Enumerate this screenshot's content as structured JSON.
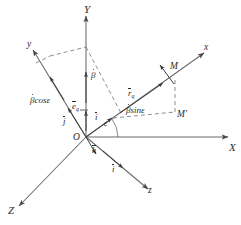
{
  "figure": {
    "background_color": "#ffffff",
    "line_color": "#555555",
    "text_color": "#2b2b2b",
    "width": 241,
    "height": 225
  },
  "axes": {
    "fixed_frame": [
      {
        "name": "axis-X",
        "label": "X",
        "direction": "right"
      },
      {
        "name": "axis-Y",
        "label": "Y",
        "direction": "up"
      },
      {
        "name": "axis-Z",
        "label": "Z",
        "direction": "lower-left"
      }
    ],
    "moving_frame": [
      {
        "name": "axis-x",
        "label": "x",
        "direction": "upper-right"
      },
      {
        "name": "axis-y",
        "label": "y",
        "direction": "upper-left"
      },
      {
        "name": "axis-z",
        "label": "z",
        "direction": "lower-right"
      }
    ]
  },
  "origin": {
    "label": "O"
  },
  "unit_vectors": [
    {
      "name": "unit-vector-i",
      "label": "i"
    },
    {
      "name": "unit-vector-j",
      "label": "j"
    },
    {
      "name": "unit-vector-k",
      "label": "k"
    },
    {
      "name": "unit-vector-i-prime",
      "label": "i"
    }
  ],
  "points": [
    {
      "name": "point-M",
      "label": "M"
    },
    {
      "name": "point-M-prime",
      "label": "M'"
    }
  ],
  "vector_labels": [
    {
      "name": "vector-r-q",
      "base": "r",
      "sub": "q"
    },
    {
      "name": "vector-e-q",
      "base": "e",
      "sub": "q"
    }
  ],
  "expressions": [
    {
      "name": "expr-beta-cos-epsilon",
      "beta": "β",
      "rest": "cosε"
    },
    {
      "name": "expr-beta-sin-epsilon",
      "beta": "β",
      "rest": "sinε"
    },
    {
      "name": "expr-beta-dot",
      "beta": "β"
    }
  ],
  "angles": [
    {
      "name": "angle-epsilon",
      "label": "ε"
    }
  ]
}
